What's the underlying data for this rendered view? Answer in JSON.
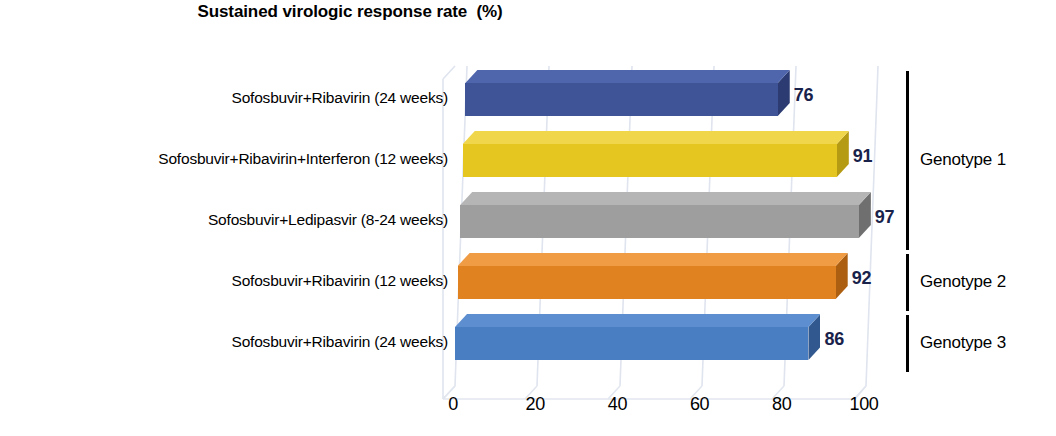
{
  "chart_data": {
    "type": "bar",
    "orientation": "horizontal",
    "style": "3d",
    "title": "Sustained virologic response rate  (%)",
    "xlabel": "",
    "ylabel": "",
    "xlim": [
      0,
      100
    ],
    "xticks": [
      "0",
      "20",
      "40",
      "60",
      "80",
      "100"
    ],
    "grid": true,
    "grid_axis": "x",
    "legend": "none",
    "categories": [
      "Sofosbuvir+Ribavirin (24 weeks)",
      "Sofosbuvir+Ribavirin+Interferon (12 weeks)",
      "Sofosbuvir+Ledipasvir (8-24 weeks)",
      "Sofosbuvir+Ribavirin (12 weeks)",
      "Sofosbuvir+Ribavirin (24 weeks)"
    ],
    "values": [
      76,
      91,
      97,
      92,
      86
    ],
    "data_labels": [
      "76",
      "91",
      "97",
      "92",
      "86"
    ],
    "bar_colors": [
      "#3f5496",
      "#e5c520",
      "#9e9e9e",
      "#e0821f",
      "#4a7ec2"
    ],
    "bar_top_colors": [
      "#4f66ad",
      "#f0d64a",
      "#b5b5b5",
      "#ef9c44",
      "#5d8fd0"
    ],
    "bar_side_colors": [
      "#2c3c72",
      "#b59a13",
      "#6f6f6f",
      "#ac5f11",
      "#32598f"
    ],
    "data_label_color": "#19224a",
    "groups": [
      {
        "label": "Genotype 1",
        "bar_indices": [
          0,
          1,
          2
        ]
      },
      {
        "label": "Genotype 2",
        "bar_indices": [
          3
        ]
      },
      {
        "label": "Genotype 3",
        "bar_indices": [
          4
        ]
      }
    ]
  }
}
